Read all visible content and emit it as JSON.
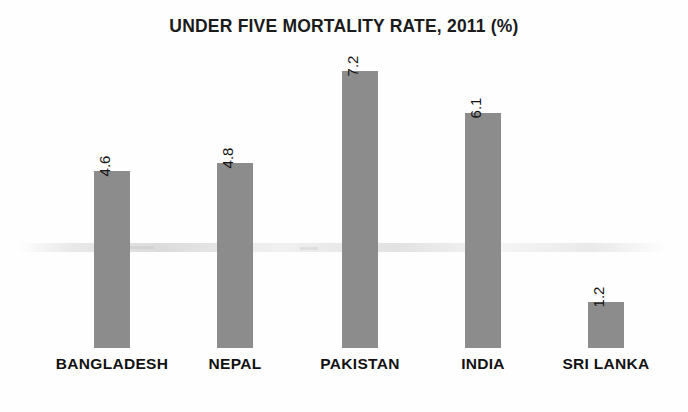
{
  "chart_data": {
    "type": "bar",
    "title": "UNDER FIVE MORTALITY RATE, 2011 (%)",
    "categories": [
      "BANGLADESH",
      "NEPAL",
      "PAKISTAN",
      "INDIA",
      "SRI LANKA"
    ],
    "values": [
      4.6,
      4.8,
      7.2,
      6.1,
      1.2
    ],
    "value_labels": [
      "4.6",
      "4.8",
      "7.2",
      "6.1",
      "1.2"
    ],
    "xlabel": "",
    "ylabel": "",
    "ylim": [
      0,
      7.8
    ],
    "grid": false,
    "legend": false,
    "legend_position": "none",
    "axis_visible": false,
    "tick_labels_y": [],
    "value_label_rotation": 90,
    "bar_color": "#8c8c8c",
    "background_color": "#ffffff",
    "text_color": "#121212"
  }
}
